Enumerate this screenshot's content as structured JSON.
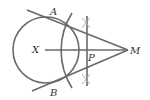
{
  "diagram": {
    "type": "geometry-construction",
    "colors": {
      "line": "#6a6a6a",
      "construction": "#b0b0b0",
      "label": "#333333",
      "background": "#ffffff"
    },
    "points": {
      "A": {
        "label": "A"
      },
      "B": {
        "label": "B"
      },
      "X": {
        "label": "X"
      },
      "P": {
        "label": "P"
      },
      "M": {
        "label": "M"
      }
    }
  }
}
